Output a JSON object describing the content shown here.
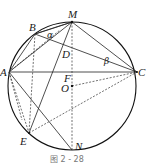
{
  "figure": {
    "caption": "图 2 - 28",
    "circle": {
      "center_label": "O",
      "cx": 72,
      "cy": 86,
      "r": 64
    },
    "points": {
      "M": {
        "label": "M",
        "x": 72,
        "y": 22
      },
      "B": {
        "label": "B",
        "x": 35,
        "y": 34
      },
      "A": {
        "label": "A",
        "x": 9,
        "y": 72
      },
      "C": {
        "label": "C",
        "x": 137,
        "y": 72
      },
      "D": {
        "label": "D",
        "x": 63,
        "y": 48
      },
      "F": {
        "label": "F",
        "x": 72,
        "y": 72
      },
      "O": {
        "label": "O",
        "x": 72,
        "y": 86
      },
      "E": {
        "label": "E",
        "x": 29,
        "y": 133
      },
      "N": {
        "label": "N",
        "x": 72,
        "y": 150
      }
    },
    "angles": {
      "alpha": "α",
      "beta": "β"
    },
    "solid_segments": [
      "AB",
      "BM",
      "AM",
      "MC",
      "AC",
      "BC",
      "ME",
      "AN"
    ],
    "dashed_segments": [
      "MN",
      "BE",
      "AE",
      "EC",
      "OC",
      "BD"
    ]
  }
}
